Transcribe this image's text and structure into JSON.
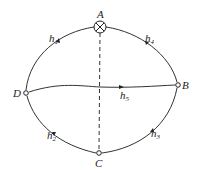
{
  "diagram": {
    "type": "network-graph",
    "nodes": [
      {
        "id": "A",
        "label": "A",
        "kind": "source-crossed-circle"
      },
      {
        "id": "B",
        "label": "B",
        "kind": "node"
      },
      {
        "id": "C",
        "label": "C",
        "kind": "node"
      },
      {
        "id": "D",
        "label": "D",
        "kind": "node"
      }
    ],
    "edges": [
      {
        "id": "h1",
        "label": "h",
        "sub": "1",
        "from": "A",
        "to": "D"
      },
      {
        "id": "h2",
        "label": "h",
        "sub": "2",
        "from": "D",
        "to": "C"
      },
      {
        "id": "h3",
        "label": "h",
        "sub": "3",
        "from": "C",
        "to": "B"
      },
      {
        "id": "h4",
        "label": "h",
        "sub": "4",
        "from": "A",
        "to": "B"
      },
      {
        "id": "h5",
        "label": "h",
        "sub": "5",
        "from": "D",
        "to": "B"
      }
    ],
    "dashed_line": {
      "from": "A",
      "to": "C"
    }
  }
}
